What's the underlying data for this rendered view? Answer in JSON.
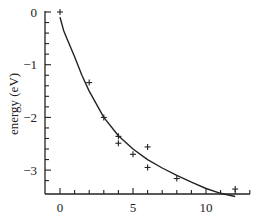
{
  "chart_data": {
    "type": "scatter",
    "title": "",
    "xlabel": "",
    "ylabel": "energy (eV)",
    "xlim": [
      -1,
      13
    ],
    "ylim": [
      -3.45,
      0.05
    ],
    "xticks": [
      0,
      5,
      10
    ],
    "xtick_labels": [
      "0",
      "5",
      "10"
    ],
    "yticks": [
      0,
      -1,
      -2,
      -3
    ],
    "ytick_labels": [
      "0",
      "−1",
      "−2",
      "−3"
    ],
    "grid": false,
    "legend": null,
    "series": [
      {
        "name": "data",
        "kind": "scatter",
        "marker": "+",
        "x": [
          0,
          2,
          3,
          4,
          4,
          5,
          6,
          6,
          8,
          12
        ],
        "y": [
          0,
          -1.34,
          -2.0,
          -2.36,
          -2.49,
          -2.7,
          -2.56,
          -2.95,
          -3.16,
          -3.36
        ]
      },
      {
        "name": "fit",
        "kind": "line",
        "x": [
          0,
          0.25,
          0.5,
          1,
          1.5,
          2,
          3,
          4,
          5,
          6,
          7,
          8,
          9,
          10,
          11,
          12
        ],
        "y": [
          -0.1,
          -0.35,
          -0.52,
          -0.85,
          -1.2,
          -1.5,
          -2.0,
          -2.35,
          -2.6,
          -2.8,
          -2.96,
          -3.1,
          -3.23,
          -3.35,
          -3.44,
          -3.5
        ]
      }
    ]
  }
}
